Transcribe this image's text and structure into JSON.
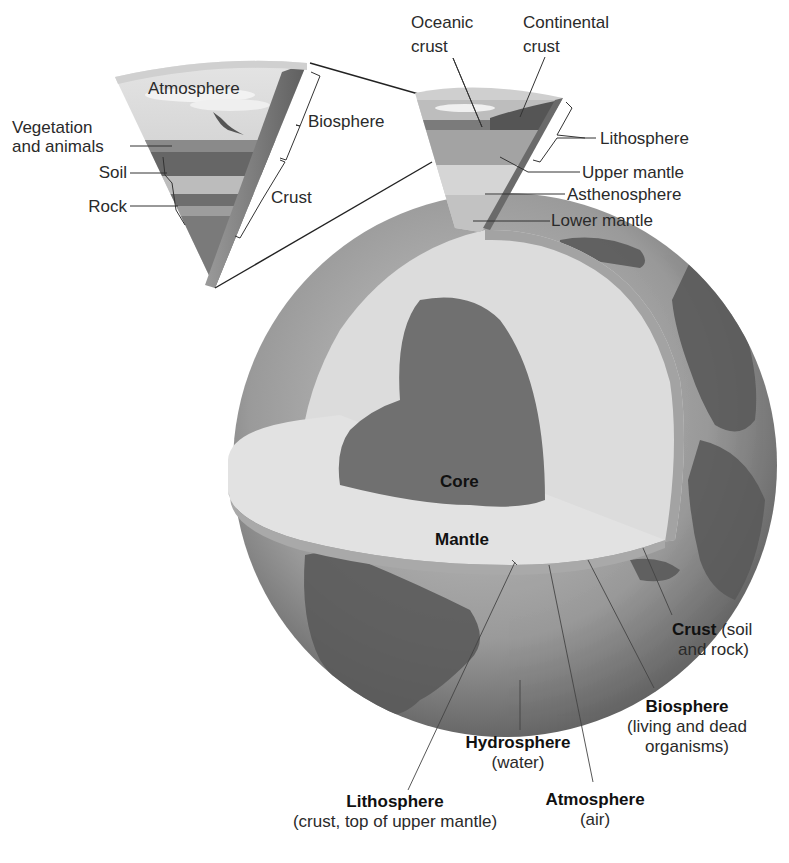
{
  "diagram": {
    "title_region": "Earth structure and spheres",
    "colors": {
      "background": "#ffffff",
      "core": "#6f6f6f",
      "mantle_cut": "#d9d9d9",
      "crust_band": "#a9a9a9",
      "ocean": "#8e8e8e",
      "land": "#5c5c5c",
      "sky": "#cfcfcf",
      "soil": "#666666",
      "rock": "#7a7a7a",
      "line": "#333333"
    },
    "inset_left": {
      "label_atmosphere": "Atmosphere",
      "label_vegetation_line1": "Vegetation",
      "label_vegetation_line2": "and animals",
      "label_soil": "Soil",
      "label_rock": "Rock",
      "label_biosphere": "Biosphere",
      "label_crust": "Crust"
    },
    "inset_right": {
      "label_oceanic_line1": "Oceanic",
      "label_oceanic_line2": "crust",
      "label_continental_line1": "Continental",
      "label_continental_line2": "crust",
      "label_lithosphere": "Lithosphere",
      "label_upper_mantle": "Upper mantle",
      "label_asthenosphere": "Asthenosphere",
      "label_lower_mantle": "Lower mantle"
    },
    "globe": {
      "label_core": "Core",
      "label_mantle": "Mantle"
    },
    "bottom_labels": {
      "crust": {
        "title": "Crust",
        "desc_line1": "(soil",
        "desc_line2": "and rock)"
      },
      "biosphere": {
        "title": "Biosphere",
        "desc_line1": "(living and dead",
        "desc_line2": "organisms)"
      },
      "hydrosphere": {
        "title": "Hydrosphere",
        "desc_line1": "(water)"
      },
      "atmosphere": {
        "title": "Atmosphere",
        "desc_line1": "(air)"
      },
      "lithosphere": {
        "title": "Lithosphere",
        "desc_line1": "(crust, top of upper mantle)"
      }
    }
  }
}
